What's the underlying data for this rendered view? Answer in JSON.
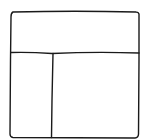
{
  "diagram": {
    "type": "wireframe-layout-icon",
    "regions": [
      {
        "name": "header",
        "label": ""
      },
      {
        "name": "sidebar",
        "label": ""
      },
      {
        "name": "main-content",
        "label": ""
      }
    ],
    "stroke_color": "#1a1a1a",
    "background": "#ffffff"
  }
}
